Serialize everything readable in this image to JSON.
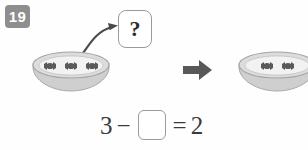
{
  "problem": {
    "number": "19"
  },
  "question_card": {
    "symbol": "?"
  },
  "scene": {
    "left_bowl": {
      "icon": "bowl-icon",
      "candy_icon": "candy-icon",
      "candy_count": 3
    },
    "right_bowl": {
      "icon": "bowl-icon",
      "candy_icon": "candy-icon",
      "candy_count": 2
    },
    "transition_arrow_icon": "right-arrow-icon",
    "curved_arrow_icon": "curved-arrow-icon"
  },
  "equation": {
    "first_term": "3",
    "operator": "−",
    "answer_blank": "",
    "equals": "=",
    "result": "2"
  },
  "colors": {
    "badge_bg": "#8e8e8e",
    "badge_text": "#ffffff",
    "bowl_body": "#d8d8d8",
    "bowl_rim": "#b6b6b6",
    "bowl_interior": "#f1f1f1",
    "candy": "#575757",
    "arrow": "#585858",
    "outline": "#9a9a9a",
    "equation_text": "#3a3a3a",
    "page_bg": "#fefefe"
  }
}
